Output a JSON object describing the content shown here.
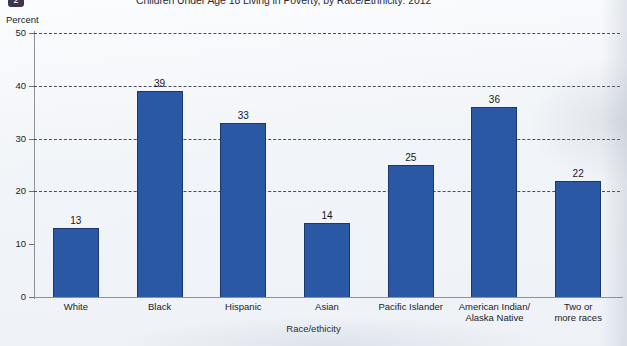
{
  "figure": {
    "badge_label": "2",
    "title": "Children Under Age 18 Living in Poverty, by Race/Ethnicity: 2012"
  },
  "chart_data": {
    "type": "bar",
    "title": "Children Under Age 18 Living in Poverty, by Race/Ethnicity: 2012",
    "xlabel": "Race/ethicity",
    "ylabel": "Percent",
    "ylim": [
      0,
      50
    ],
    "yticks": [
      0,
      10,
      20,
      30,
      40,
      50
    ],
    "ytick_labels": [
      "0",
      "10",
      "20",
      "30",
      "40",
      "50"
    ],
    "gridlines_at": [
      20,
      30,
      40,
      50
    ],
    "grid": true,
    "legend": "none",
    "bar_color": "#2a58a4",
    "categories": [
      "White",
      "Black",
      "Hispanic",
      "Asian",
      "Pacific Islander",
      "American Indian/ Alaska Native",
      "Two or more races"
    ],
    "category_lines": [
      [
        "White"
      ],
      [
        "Black"
      ],
      [
        "Hispanic"
      ],
      [
        "Asian"
      ],
      [
        "Pacific Islander"
      ],
      [
        "American Indian/",
        "Alaska Native"
      ],
      [
        "Two or",
        "more races"
      ]
    ],
    "values": [
      13,
      39,
      33,
      14,
      25,
      36,
      22
    ],
    "value_labels": [
      "13",
      "39",
      "33",
      "14",
      "25",
      "36",
      "22"
    ]
  }
}
